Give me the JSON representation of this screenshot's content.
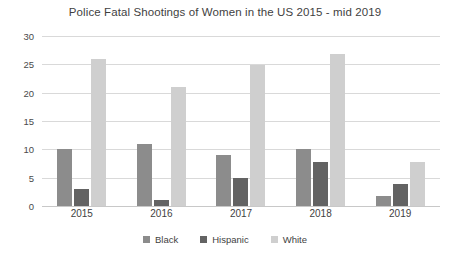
{
  "chart_data": {
    "type": "bar",
    "title": "Police Fatal Shootings of Women in the US 2015 - mid 2019",
    "xlabel": "",
    "ylabel": "",
    "categories": [
      "2015",
      "2016",
      "2017",
      "2018",
      "2019"
    ],
    "series": [
      {
        "name": "Black",
        "color": "#8c8c8c",
        "values": [
          10,
          11,
          9,
          10,
          1.7
        ]
      },
      {
        "name": "Hispanic",
        "color": "#636363",
        "values": [
          3,
          1,
          5,
          7.8,
          3.8
        ]
      },
      {
        "name": "White",
        "color": "#cfcfcf",
        "values": [
          26,
          21,
          24.8,
          26.8,
          7.8
        ]
      }
    ],
    "ylim": [
      0,
      30
    ],
    "yticks": [
      0,
      5,
      10,
      15,
      20,
      25,
      30
    ],
    "ytick_labels": [
      "0",
      "5",
      "10",
      "15",
      "20",
      "25",
      "30"
    ],
    "grid": true,
    "legend_position": "bottom"
  }
}
